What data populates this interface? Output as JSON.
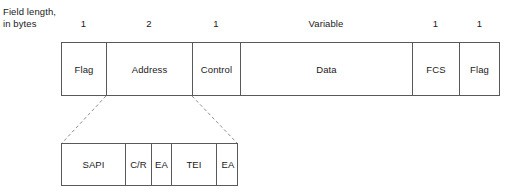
{
  "caption": {
    "line1": "Field length,",
    "line2": "in bytes"
  },
  "main_frame": {
    "name": "HDLC/LAPD frame format",
    "fields": [
      {
        "label": "Flag",
        "size": "1"
      },
      {
        "label": "Address",
        "size": "2"
      },
      {
        "label": "Control",
        "size": "1"
      },
      {
        "label": "Data",
        "size": "Variable"
      },
      {
        "label": "FCS",
        "size": "1"
      },
      {
        "label": "Flag",
        "size": "1"
      }
    ]
  },
  "sub_frame": {
    "name": "Address field expansion",
    "expands_field": "Address",
    "fields": [
      {
        "label": "SAPI"
      },
      {
        "label": "C/R"
      },
      {
        "label": "EA"
      },
      {
        "label": "TEI"
      },
      {
        "label": "EA"
      }
    ]
  },
  "colors": {
    "stroke": "#58595b",
    "dashed_stroke": "#8a8b8d",
    "text": "#1a1a1a",
    "background": "#ffffff"
  }
}
